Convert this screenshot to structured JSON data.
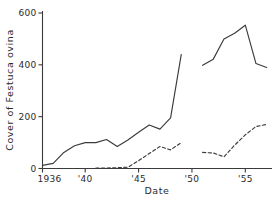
{
  "chart_data": {
    "type": "line",
    "title": "",
    "xlabel": "Date",
    "ylabel": "Cover of Festuca ovina",
    "xlim": [
      1936,
      1957.5
    ],
    "ylim": [
      0,
      600
    ],
    "grid": false,
    "legend": null,
    "x_tick_labels": [
      "1936",
      "'40",
      "'45",
      "'50",
      "'55"
    ],
    "x_tick_values": [
      1936,
      1940,
      1945,
      1950,
      1955
    ],
    "y_tick_labels": [
      "0",
      "200",
      "400",
      "600"
    ],
    "y_tick_values": [
      0,
      200,
      400,
      600
    ],
    "series": [
      {
        "name": "solid-series-segment-1",
        "style": "solid",
        "x": [
          1936,
          1937,
          1938,
          1939,
          1940,
          1941,
          1942,
          1943,
          1944,
          1945,
          1946,
          1947,
          1948,
          1949
        ],
        "values": [
          12,
          20,
          62,
          88,
          100,
          100,
          112,
          85,
          110,
          140,
          168,
          152,
          195,
          440
        ]
      },
      {
        "name": "solid-series-segment-2",
        "style": "solid",
        "x": [
          1951,
          1952,
          1953,
          1954,
          1955,
          1956,
          1957
        ],
        "values": [
          398,
          422,
          500,
          522,
          553,
          405,
          390
        ]
      },
      {
        "name": "dashed-series-segment-1",
        "style": "dashed",
        "x": [
          1941,
          1942,
          1943,
          1944,
          1945,
          1946,
          1947,
          1948,
          1949
        ],
        "values": [
          2,
          2,
          3,
          5,
          30,
          58,
          85,
          72,
          100
        ]
      },
      {
        "name": "dashed-series-segment-2",
        "style": "dashed",
        "x": [
          1951,
          1952,
          1953,
          1954,
          1955,
          1956,
          1957
        ],
        "values": [
          62,
          60,
          45,
          90,
          130,
          162,
          170
        ]
      }
    ],
    "annotations": [
      "Data break between 1949 and 1951 on both series"
    ],
    "detail_points": {
      "solid_peak_value": 553,
      "solid_peak_year": 1955,
      "solid_segment1_end_value": 440,
      "solid_segment2_start_value": 398,
      "dashed_final_value": 170
    }
  },
  "colors": {
    "line": "#3b3b3b",
    "axis": "#3a3a3a",
    "text": "#2b2b2b",
    "background": "#ffffff"
  }
}
